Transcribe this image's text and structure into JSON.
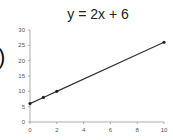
{
  "chart_data": {
    "type": "line",
    "title": "y = 2x + 6",
    "xlabel": "",
    "ylabel": "",
    "x": [
      0,
      1,
      2,
      10
    ],
    "values": [
      6,
      8,
      10,
      26
    ],
    "xlim": [
      0,
      10
    ],
    "ylim": [
      0,
      30
    ],
    "xticks": [
      0,
      2,
      4,
      6,
      8,
      10
    ],
    "yticks": [
      0,
      5,
      10,
      15,
      20,
      25,
      30
    ],
    "grid": false,
    "legend": "none",
    "line_color": "#333333"
  },
  "left_fragment": ")"
}
